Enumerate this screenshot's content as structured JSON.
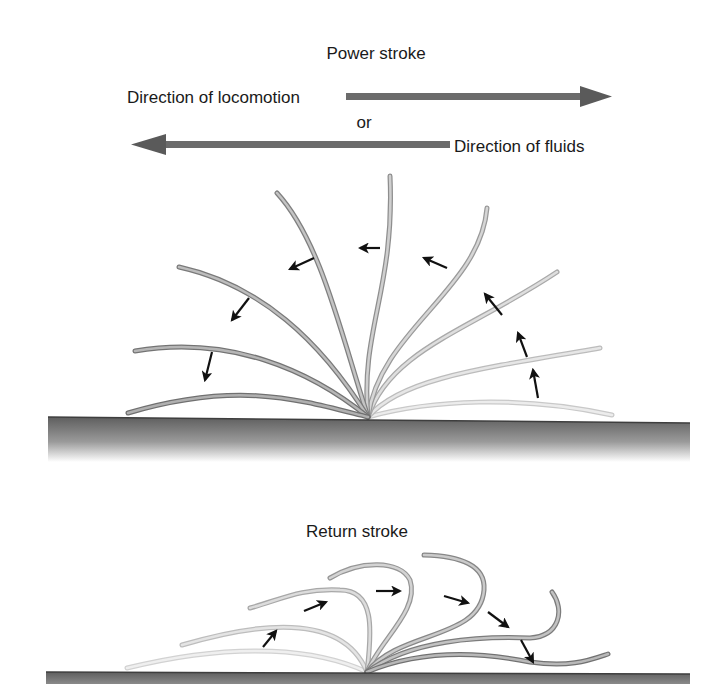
{
  "power_stroke": {
    "title": "Power stroke",
    "locomotion_label": "Direction of locomotion",
    "or_label": "or",
    "fluids_label": "Direction of fluids"
  },
  "return_stroke": {
    "title": "Return stroke"
  },
  "colors": {
    "arrow_bar": "#6b6b6b",
    "cilium_dark": "#7a7a7a",
    "cilium_light": "#d0d0d0",
    "surface_top": "#6e6e6e",
    "surface_bottom": "#ffffff",
    "motion_arrow": "#111111"
  }
}
